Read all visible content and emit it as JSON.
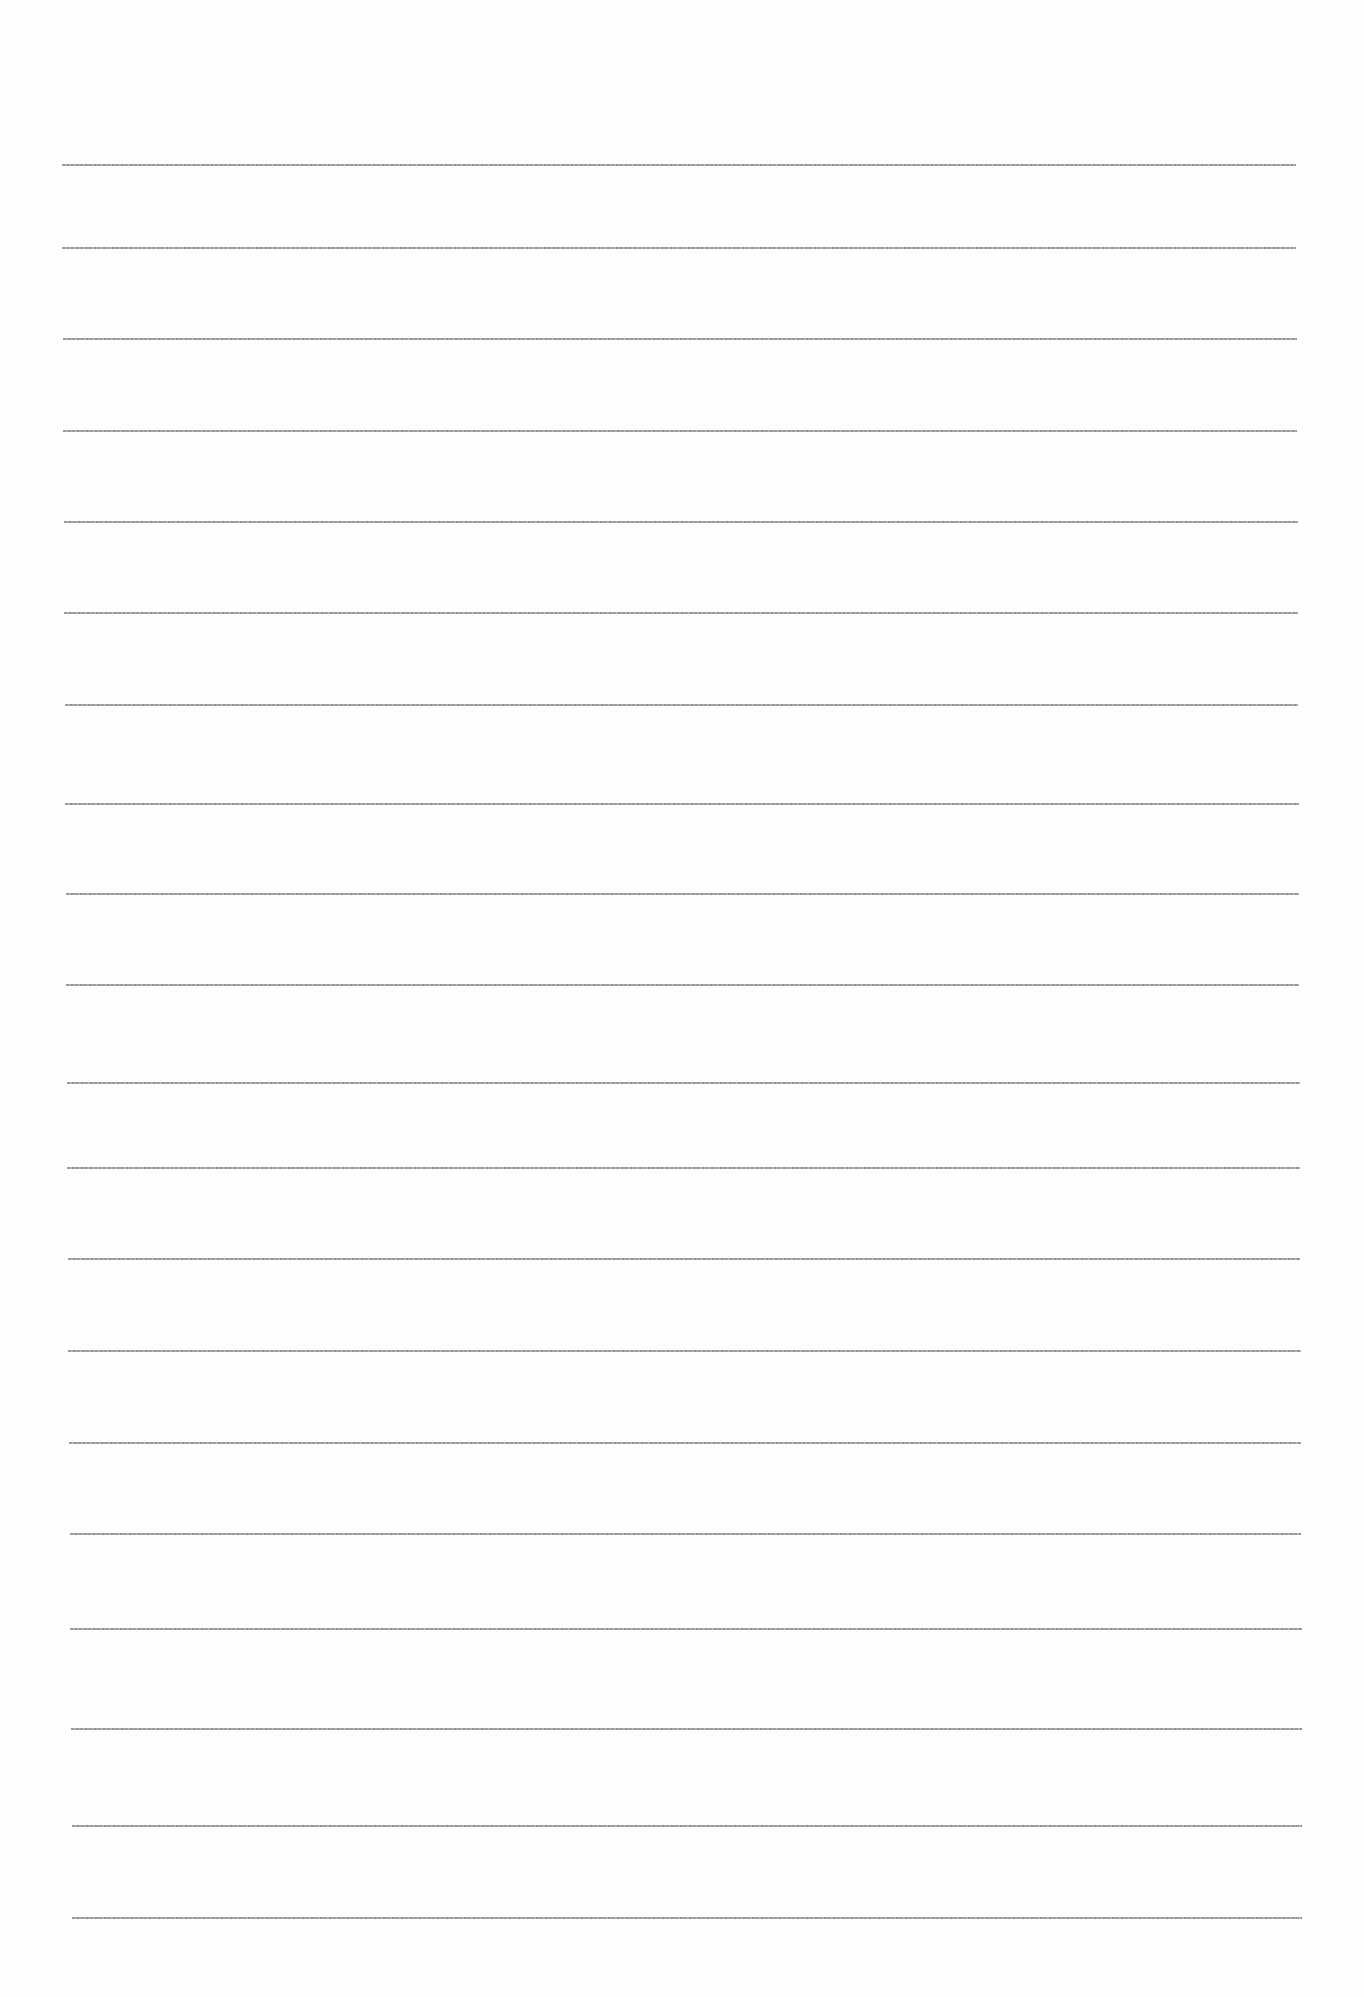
{
  "document": {
    "type": "ruled-paper",
    "background_color": "#fdfdfd",
    "line_color": "#8a8a8a",
    "line_count": 20,
    "lines": [
      {
        "y": 164,
        "x1": 62,
        "x2": 1296
      },
      {
        "y": 247,
        "x1": 62,
        "x2": 1296
      },
      {
        "y": 338,
        "x1": 63,
        "x2": 1297
      },
      {
        "y": 430,
        "x1": 63,
        "x2": 1297
      },
      {
        "y": 521,
        "x1": 64,
        "x2": 1298
      },
      {
        "y": 612,
        "x1": 64,
        "x2": 1298
      },
      {
        "y": 704,
        "x1": 65,
        "x2": 1298
      },
      {
        "y": 803,
        "x1": 65,
        "x2": 1299
      },
      {
        "y": 893,
        "x1": 66,
        "x2": 1299
      },
      {
        "y": 984,
        "x1": 66,
        "x2": 1299
      },
      {
        "y": 1082,
        "x1": 67,
        "x2": 1300
      },
      {
        "y": 1167,
        "x1": 67,
        "x2": 1300
      },
      {
        "y": 1258,
        "x1": 68,
        "x2": 1300
      },
      {
        "y": 1350,
        "x1": 68,
        "x2": 1301
      },
      {
        "y": 1442,
        "x1": 69,
        "x2": 1301
      },
      {
        "y": 1533,
        "x1": 70,
        "x2": 1301
      },
      {
        "y": 1628,
        "x1": 70,
        "x2": 1302
      },
      {
        "y": 1728,
        "x1": 71,
        "x2": 1302
      },
      {
        "y": 1825,
        "x1": 72,
        "x2": 1302
      },
      {
        "y": 1917,
        "x1": 72,
        "x2": 1302
      }
    ]
  }
}
